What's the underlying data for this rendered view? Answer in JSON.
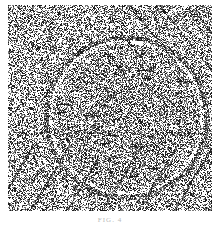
{
  "figure": {
    "caption": "FIG. 4",
    "colors": {
      "dark": "#1a1a1a",
      "light": "#ffffff",
      "mid": "#8a8a8a"
    }
  }
}
